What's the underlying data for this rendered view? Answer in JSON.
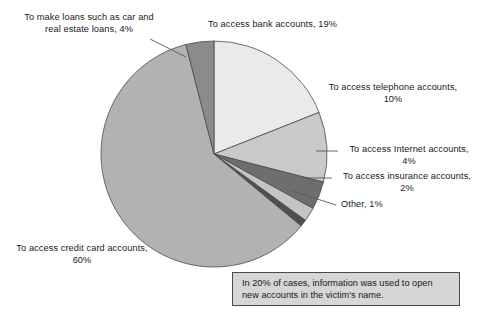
{
  "chart_data": {
    "type": "pie",
    "title": "",
    "xlabel": "",
    "ylabel": "",
    "legend_position": "none",
    "grid": false,
    "unit": "%",
    "categories": [
      "To access bank accounts",
      "To access telephone accounts",
      "To access Internet accounts",
      "To access insurance accounts",
      "Other",
      "To access credit card accounts",
      "To make loans such as car and real estate loans"
    ],
    "values": [
      19,
      10,
      4,
      2,
      1,
      60,
      4
    ],
    "slices": [
      {
        "id": "bank",
        "label": "To access bank accounts, 19%",
        "name": "To access bank accounts",
        "value": 19,
        "color": "#eaeaea",
        "start_deg": 0,
        "end_deg": 68.4
      },
      {
        "id": "telephone",
        "label": "To access telephone accounts,\n10%",
        "name": "To access telephone accounts",
        "value": 10,
        "color": "#c9c9c9",
        "start_deg": 68.4,
        "end_deg": 104.4
      },
      {
        "id": "internet",
        "label": "To access Internet accounts,\n4%",
        "name": "To access Internet accounts",
        "value": 4,
        "color": "#6e6e6e",
        "start_deg": 104.4,
        "end_deg": 118.8
      },
      {
        "id": "insurance",
        "label": "To access insurance accounts,\n2%",
        "name": "To access insurance accounts",
        "value": 2,
        "color": "#c4c4c4",
        "start_deg": 118.8,
        "end_deg": 126.0
      },
      {
        "id": "other",
        "label": "Other, 1%",
        "name": "Other",
        "value": 1,
        "color": "#4f4f4f",
        "start_deg": 126.0,
        "end_deg": 129.6
      },
      {
        "id": "credit",
        "label": "To access credit card accounts,\n60%",
        "name": "To access credit card accounts",
        "value": 60,
        "color": "#b2b2b2",
        "start_deg": 129.6,
        "end_deg": 345.6
      },
      {
        "id": "loans",
        "label": "To make loans such as car and\nreal estate loans, 4%",
        "name": "To make loans such as car and real estate loans",
        "value": 4,
        "color": "#8b8b8b",
        "start_deg": 345.6,
        "end_deg": 360
      }
    ],
    "annotation": "In 20% of cases, information was used to open new accounts in the victim's name."
  },
  "labels": {
    "loans": "To make loans such as car and\nreal estate loans, 4%",
    "bank": "To access bank accounts, 19%",
    "telephone": "To access telephone accounts,\n10%",
    "internet": "To access Internet accounts,\n4%",
    "insurance": "To access insurance accounts,\n2%",
    "other": "Other, 1%",
    "credit": "To access credit card accounts,\n60%"
  },
  "callout": {
    "text": "In 20% of cases, information was used to open new accounts in the victim's name."
  },
  "colors": {
    "outline": "#4a4a4a",
    "leader_line": "#585858",
    "callout_background": "#d6d6d6",
    "callout_border": "#4a4a4a",
    "page_background": "#ffffff",
    "text": "#16191c"
  }
}
